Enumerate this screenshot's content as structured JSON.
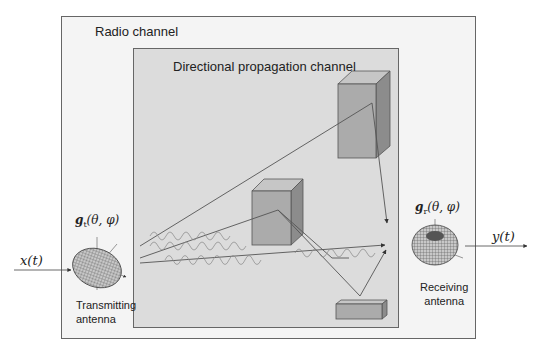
{
  "diagram": {
    "outer_box_label": "Radio channel",
    "inner_box_label": "Directional propagation channel",
    "transmitter": {
      "gain_label": "g_t(θ,φ)",
      "gain_main": "g",
      "gain_sub": "t",
      "gain_args": "(θ, φ)",
      "label_line1": "Transmitting",
      "label_line2": "antenna"
    },
    "receiver": {
      "gain_label": "g_r(θ,φ)",
      "gain_main": "g",
      "gain_sub": "r",
      "gain_args": "(θ, φ)",
      "label_line1": "Receiving",
      "label_line2": "antenna"
    },
    "input_signal": "x(t)",
    "output_signal": "y(t)",
    "scatterers": [
      "tall-building",
      "middle-building",
      "ground-block"
    ],
    "colors": {
      "outer_fill": "#f3f3f3",
      "inner_fill": "#d9d9d9",
      "box_front": "#a9a9a9",
      "box_top": "#c4c4c4",
      "box_side": "#8a8a8a",
      "ray": "#555555",
      "wave": "#8c8c8c"
    }
  }
}
